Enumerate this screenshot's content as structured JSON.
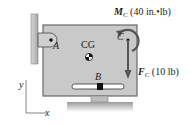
{
  "diagram": {
    "labels": {
      "A": "A",
      "B": "B",
      "C": "C",
      "CG": "CG",
      "x_axis": "x",
      "y_axis": "y"
    },
    "moment": {
      "symbol": "M",
      "subscript": "C",
      "value": "(40 in.•lb)"
    },
    "force": {
      "symbol": "F",
      "subscript": "C",
      "value": "(10 lb)"
    },
    "colors": {
      "plate": "#c9c9c9",
      "plate_border": "#6a6a6a",
      "wall": "#b8b8b8",
      "arrow": "#555555",
      "text": "#222222"
    }
  }
}
